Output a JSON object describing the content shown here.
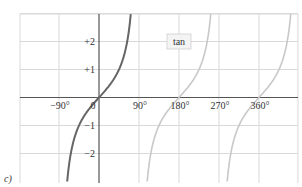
{
  "chart_data": {
    "type": "line",
    "title": "",
    "panel_label": "c)",
    "xlabel": "",
    "ylabel": "",
    "xlim": [
      -178,
      448
    ],
    "ylim": [
      -3,
      3
    ],
    "grid": true,
    "x_ticks": [
      {
        "value": -90,
        "label": "−90°"
      },
      {
        "value": 0,
        "label": "0"
      },
      {
        "value": 90,
        "label": "90°"
      },
      {
        "value": 180,
        "label": "180°"
      },
      {
        "value": 270,
        "label": "270°"
      },
      {
        "value": 360,
        "label": "360°"
      }
    ],
    "y_ticks": [
      {
        "value": 2,
        "label": "+2"
      },
      {
        "value": 1,
        "label": "+1"
      },
      {
        "value": -1,
        "label": "−1"
      },
      {
        "value": -2,
        "label": "−2"
      }
    ],
    "legend": {
      "label": "tan",
      "position": "upper-center"
    },
    "series": [
      {
        "name": "tan (principal branch)",
        "function": "tan(x)",
        "domain": [
          -90,
          90
        ],
        "color": "#666666",
        "x": [
          -71.6,
          -63.4,
          -45,
          -26.6,
          0,
          26.6,
          45,
          63.4,
          71.6
        ],
        "y": [
          -3,
          -2,
          -1,
          -0.5,
          0,
          0.5,
          1,
          2,
          3
        ]
      },
      {
        "name": "tan (branch 2)",
        "function": "tan(x)",
        "domain": [
          90,
          270
        ],
        "color": "#c8c8c8",
        "x": [
          108.4,
          116.6,
          135,
          153.4,
          180,
          206.6,
          225,
          243.4,
          251.6
        ],
        "y": [
          -3,
          -2,
          -1,
          -0.5,
          0,
          0.5,
          1,
          2,
          3
        ]
      },
      {
        "name": "tan (branch 3)",
        "function": "tan(x)",
        "domain": [
          270,
          450
        ],
        "color": "#c8c8c8",
        "x": [
          288.4,
          296.6,
          315,
          333.4,
          360,
          386.6,
          405,
          423.4,
          431.6
        ],
        "y": [
          -3,
          -2,
          -1,
          -0.5,
          0,
          0.5,
          1,
          2,
          3
        ]
      }
    ]
  },
  "colors": {
    "grid": "#d9d9d9",
    "axis": "#555555",
    "primary_curve": "#666666",
    "secondary_curve": "#c8c8c8",
    "text": "#333333"
  }
}
